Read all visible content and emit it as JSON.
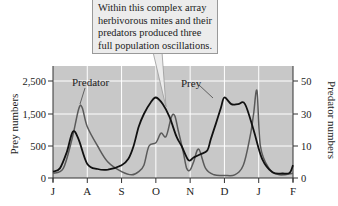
{
  "callout": {
    "text": "Within this complex array herbivorous mites and their predators produced three full population oscillations."
  },
  "colors": {
    "plot_bg": "#c8c8c8",
    "grid": "#ffffff",
    "prey_line": "#111111",
    "predator_line": "#5a5a5a",
    "callout_bg": "#ececec",
    "callout_border": "#999999"
  },
  "chart_data": {
    "type": "line",
    "title": "",
    "xlabel": "",
    "ylabel": "Prey numbers",
    "y2label": "Predator numbers",
    "categories": [
      "J",
      "A",
      "S",
      "O",
      "N",
      "D",
      "J",
      "F"
    ],
    "yticks": [
      "0",
      "500",
      "1,500",
      "2,500"
    ],
    "y2ticks": [
      "0",
      "10",
      "30",
      "50"
    ],
    "ylim": [
      0,
      2500
    ],
    "y2lim": [
      0,
      50
    ],
    "grid": true,
    "annotations": [
      "Predator",
      "Prey"
    ],
    "callout": "Within this complex array herbivorous mites and their predators produced three full population oscillations.",
    "series": [
      {
        "name": "Prey",
        "axis": "left",
        "x": [
          0,
          0.2,
          0.4,
          0.58,
          0.75,
          1.0,
          1.3,
          1.6,
          2.0,
          2.2,
          2.35,
          2.5,
          2.65,
          2.85,
          3.0,
          3.2,
          3.4,
          3.6,
          3.75,
          3.95,
          4.1,
          4.3,
          4.5,
          4.6,
          4.75,
          4.9,
          5.0,
          5.2,
          5.4,
          5.6,
          5.85,
          6.1,
          6.4,
          6.7,
          6.9,
          7.0
        ],
        "y": [
          100,
          150,
          400,
          950,
          700,
          220,
          140,
          130,
          200,
          300,
          500,
          1100,
          1500,
          1850,
          2000,
          1800,
          1400,
          800,
          500,
          280,
          320,
          370,
          430,
          700,
          1200,
          1700,
          2000,
          1800,
          1800,
          1800,
          1000,
          300,
          90,
          70,
          80,
          200
        ]
      },
      {
        "name": "Predator",
        "axis": "right",
        "x": [
          0,
          0.3,
          0.55,
          0.75,
          0.85,
          1.0,
          1.3,
          1.6,
          2.0,
          2.3,
          2.5,
          2.65,
          2.8,
          3.0,
          3.15,
          3.3,
          3.45,
          3.55,
          3.65,
          3.8,
          3.9,
          4.0,
          4.1,
          4.25,
          4.45,
          4.7,
          5.0,
          5.3,
          5.55,
          5.75,
          5.85,
          5.95,
          6.05,
          6.3,
          6.6,
          7.0
        ],
        "y": [
          1.5,
          3,
          14,
          33,
          34,
          22,
          10,
          5,
          2,
          1,
          2,
          4,
          10,
          12,
          18,
          16,
          28,
          29,
          20,
          8,
          3,
          2.5,
          5,
          9,
          3,
          1,
          0.8,
          1,
          4,
          16,
          30,
          44,
          10,
          3,
          1,
          1.5
        ]
      }
    ]
  }
}
